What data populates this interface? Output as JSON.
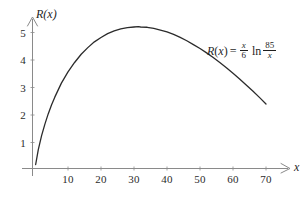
{
  "figure": {
    "background_color": "#ffffff",
    "curve_color": "#2b2b2b",
    "axis_color": "#8a8a8a",
    "text_color": "#1f1f1f"
  },
  "equation": {
    "lhs_fn": "R",
    "lhs_open": "(",
    "lhs_var": "x",
    "lhs_close": ")",
    "equals": "=",
    "coef_num": "x",
    "coef_den": "6",
    "ln": "ln",
    "arg_num": "85",
    "arg_den": "x",
    "plain": "R(x) = (x/6) ln(85/x)"
  },
  "axes": {
    "x_name": "x",
    "y_name_fn": "R",
    "y_name_open": "(",
    "y_name_var": "x",
    "y_name_close": ")",
    "y_name_plain": "R(x)"
  },
  "chart_data": {
    "type": "line",
    "title": "",
    "xlabel": "x",
    "ylabel": "R(x)",
    "xlim": [
      0,
      76
    ],
    "ylim": [
      0,
      5.6
    ],
    "grid": false,
    "legend": false,
    "annotations": [
      {
        "text": "R(x) = (x/6) ln(85/x)",
        "x": 45,
        "y": 4.4
      }
    ],
    "x_ticks": [
      10,
      20,
      30,
      40,
      50,
      60,
      70
    ],
    "x_tick_labels": [
      "10",
      "20",
      "30",
      "40",
      "50",
      "60",
      "70"
    ],
    "y_ticks": [
      1,
      2,
      3,
      4,
      5
    ],
    "y_tick_labels": [
      "1",
      "2",
      "3",
      "4",
      "5"
    ],
    "series": [
      {
        "name": "R(x) = (x/6) ln(85/x)",
        "formula": "R(x) = (x/6)*ln(85/x)",
        "color": "#2b2b2b",
        "x": [
          0.2,
          1,
          2,
          3,
          4,
          5,
          6,
          8,
          10,
          12,
          14,
          16,
          18,
          20,
          22,
          24,
          26,
          28,
          30,
          31.28,
          32,
          34,
          36,
          38,
          40,
          42,
          44,
          46,
          48,
          50,
          52,
          54,
          56,
          58,
          60,
          62,
          64,
          66,
          68,
          70
        ],
        "y": [
          0.2,
          0.74,
          1.25,
          1.67,
          2.04,
          2.36,
          2.65,
          3.16,
          3.57,
          3.91,
          4.21,
          4.45,
          4.66,
          4.82,
          4.96,
          5.06,
          5.13,
          5.18,
          5.2,
          5.21,
          5.2,
          5.19,
          5.15,
          5.09,
          5.02,
          4.93,
          4.82,
          4.7,
          4.56,
          4.42,
          4.26,
          4.09,
          3.91,
          3.72,
          3.52,
          3.31,
          3.09,
          2.87,
          2.64,
          2.4
        ],
        "max_point": {
          "x": 31.28,
          "y": 5.21
        }
      }
    ]
  }
}
